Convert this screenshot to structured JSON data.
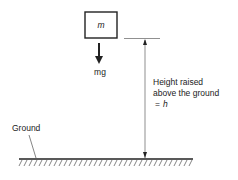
{
  "diagram": {
    "mass_label": "m",
    "force_label": "mg",
    "height_label_line1": "Height raised",
    "height_label_line2": "above the ground",
    "height_label_line3_eq": "=",
    "height_label_line3_var": "h",
    "ground_label": "Ground"
  },
  "colors": {
    "stroke": "#222222",
    "background": "#ffffff"
  }
}
